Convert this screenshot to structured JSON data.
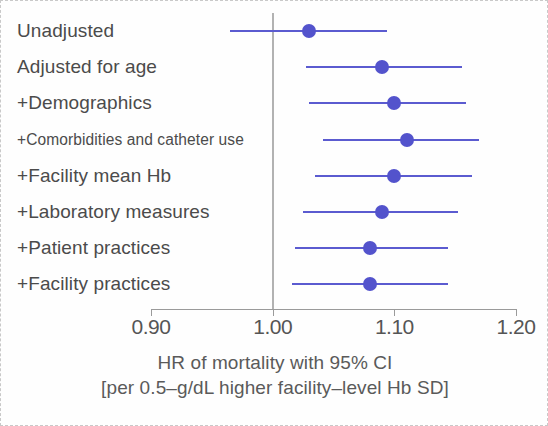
{
  "chart_data": {
    "type": "scatter",
    "subtype": "forest-plot",
    "title": "",
    "xlabel": "HR of mortality with 95% CI",
    "xlabel_line2": "[per 0.5–g/dL higher facility–level Hb SD]",
    "ylabel": "",
    "xlim": [
      0.875,
      1.22
    ],
    "xticks": [
      0.9,
      1.0,
      1.1,
      1.2
    ],
    "xtick_labels": [
      "0.90",
      "1.00",
      "1.10",
      "1.20"
    ],
    "reference_line": 1.0,
    "grid": false,
    "legend": "none",
    "categories": [
      "Unadjusted",
      "Adjusted for age",
      "+Demographics",
      "+Comorbidities and catheter use",
      "+Facility mean Hb",
      "+Laboratory measures",
      "+Patient practices",
      "+Facility practices"
    ],
    "values": [
      1.03,
      1.09,
      1.1,
      1.11,
      1.1,
      1.09,
      1.08,
      1.08
    ],
    "ci_low": [
      0.965,
      1.027,
      1.03,
      1.041,
      1.035,
      1.025,
      1.018,
      1.016
    ],
    "ci_high": [
      1.094,
      1.156,
      1.159,
      1.17,
      1.164,
      1.152,
      1.144,
      1.144
    ],
    "rows": [
      {
        "label": "Unadjusted",
        "hr": 1.03,
        "low": 0.965,
        "high": 1.094,
        "small_label": false
      },
      {
        "label": "Adjusted for age",
        "hr": 1.09,
        "low": 1.027,
        "high": 1.156,
        "small_label": false
      },
      {
        "label": "+Demographics",
        "hr": 1.1,
        "low": 1.03,
        "high": 1.159,
        "small_label": false
      },
      {
        "label": "+Comorbidities and catheter use",
        "hr": 1.11,
        "low": 1.041,
        "high": 1.17,
        "small_label": true
      },
      {
        "label": "+Facility mean Hb",
        "hr": 1.1,
        "low": 1.035,
        "high": 1.164,
        "small_label": false
      },
      {
        "label": "+Laboratory measures",
        "hr": 1.09,
        "low": 1.025,
        "high": 1.152,
        "small_label": false
      },
      {
        "label": "+Patient practices",
        "hr": 1.08,
        "low": 1.018,
        "high": 1.144,
        "small_label": false
      },
      {
        "label": "+Facility practices",
        "hr": 1.08,
        "low": 1.016,
        "high": 1.144,
        "small_label": false
      }
    ],
    "colors": {
      "marker": "#5353cc",
      "ci_line": "#5b5bd0",
      "reference_line": "#b2b2b2",
      "axis": "#9a9a9a",
      "text": "#4b4b4b",
      "border": "#c9c9c9",
      "background": "#fefefe"
    }
  }
}
